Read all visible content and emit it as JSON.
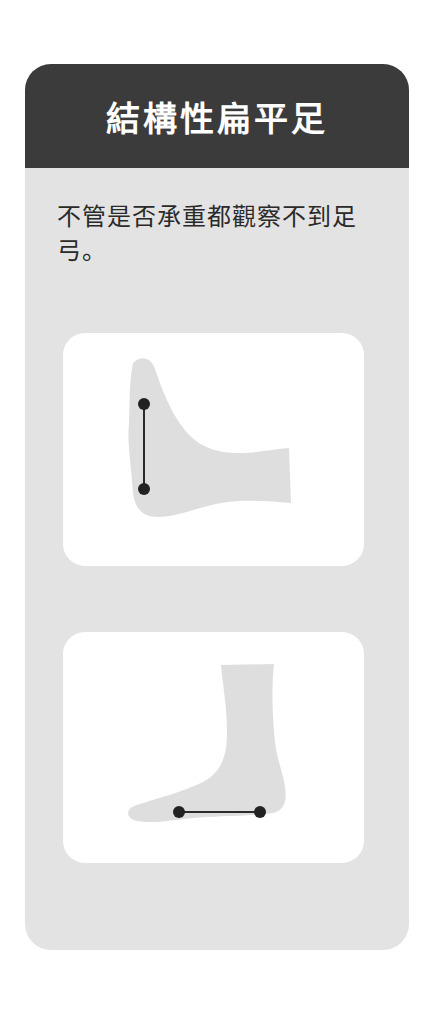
{
  "card": {
    "title": "結構性扁平足",
    "description": "不管是否承重都觀察不到足弓。",
    "colors": {
      "header_bg": "#3b3b3b",
      "body_bg": "#e3e3e3",
      "panel_bg": "#ffffff",
      "foot_fill": "#dedede",
      "marker": "#222222"
    }
  },
  "illustrations": [
    {
      "name": "foot-front-view",
      "markers": 2,
      "line": "vertical"
    },
    {
      "name": "foot-side-view",
      "markers": 2,
      "line": "horizontal"
    }
  ]
}
